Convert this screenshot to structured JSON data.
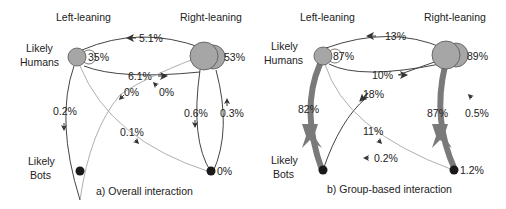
{
  "colors": {
    "human_node": "#a6a6a6",
    "human_stroke": "#555555",
    "bot_node": "#1a1a1a",
    "thin_edge": "#444444",
    "light_edge": "#9a9a9a",
    "thick_edge": "#7a7a7a",
    "text": "#222222"
  },
  "panels": [
    {
      "caption": "a) Overall interaction",
      "column_labels": {
        "left": "Left-leaning",
        "right": "Right-leaning"
      },
      "row_labels": {
        "humans": [
          "Likely",
          "Humans"
        ],
        "bots": [
          "Likely",
          "Bots"
        ]
      },
      "self_loops": {
        "left_humans": "35%",
        "right_humans": "53%",
        "right_bots": "0%"
      },
      "edges": {
        "rh_to_lh": "5.1%",
        "lh_to_rh": "6.1%",
        "rb_to_lh": "0%",
        "lh_to_rb_area": "0%",
        "lh_to_lb": "0.2%",
        "rh_to_rb": "0.6%",
        "rb_to_rh": "0.3%",
        "lh_to_rb": "0.1%"
      }
    },
    {
      "caption": "b) Group-based interaction",
      "column_labels": {
        "left": "Left-leaning",
        "right": "Right-leaning"
      },
      "row_labels": {
        "humans": [
          "Likely",
          "Humans"
        ],
        "bots": [
          "Likely",
          "Bots"
        ]
      },
      "self_loops": {
        "left_humans": "87%",
        "right_humans": "89%",
        "right_bots": "1.2%"
      },
      "edges": {
        "rh_to_lh": "13%",
        "lh_to_rh": "10%",
        "lb_to_rh": "18%",
        "rb_to_rh": "0.5%",
        "lh_to_lb": "82%",
        "rh_to_rb": "87%",
        "lh_to_rb": "11%",
        "rb_to_lb": "0.2%"
      }
    }
  ]
}
